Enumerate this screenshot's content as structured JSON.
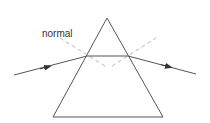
{
  "diagram": {
    "labels": {
      "normal": "normal"
    },
    "colors": {
      "prism": "#555555",
      "ray": "#555555",
      "normal_line": "#b8b8b8",
      "label": "#333333",
      "background": "#ffffff"
    },
    "prism": {
      "apex": [
        107,
        18
      ],
      "base_left": [
        53,
        117
      ],
      "base_right": [
        163,
        117
      ]
    },
    "ray": {
      "incident": {
        "from": [
          14,
          75
        ],
        "to": [
          87,
          56
        ],
        "arrow_at": [
          47,
          67
        ]
      },
      "internal": {
        "from": [
          87,
          56
        ],
        "to": [
          128,
          56
        ]
      },
      "emergent": {
        "from": [
          128,
          56
        ],
        "to": [
          196,
          74
        ],
        "arrow_at": [
          168,
          67
        ]
      }
    },
    "normals": [
      {
        "from": [
          60,
          38
        ],
        "to": [
          105,
          66
        ],
        "style": "dashed"
      },
      {
        "from": [
          112,
          66
        ],
        "to": [
          156,
          38
        ],
        "style": "dashed"
      }
    ]
  }
}
